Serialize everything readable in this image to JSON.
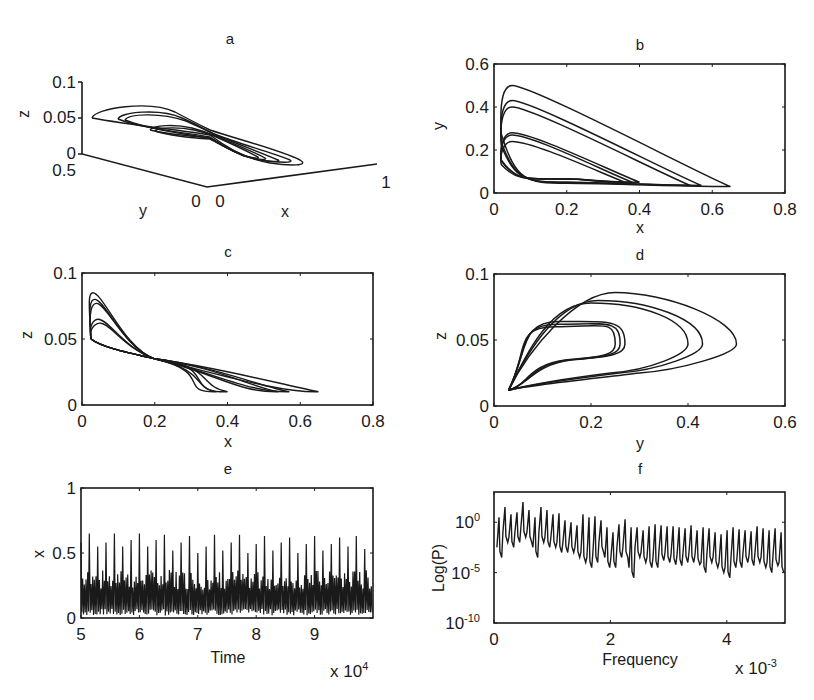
{
  "figure": {
    "panels": [
      "a",
      "b",
      "c",
      "d",
      "e",
      "f"
    ]
  },
  "chart_data": [
    {
      "id": "a",
      "type": "line",
      "title": "a",
      "projection": "3d",
      "xlabel": "x",
      "ylabel": "y",
      "zlabel": "z",
      "xticks": [
        "0",
        "1"
      ],
      "yticks": [
        "0",
        "0.5"
      ],
      "zticks": [
        "0",
        "0.05",
        "0.1"
      ],
      "xlim": [
        0,
        1
      ],
      "ylim": [
        0,
        0.5
      ],
      "zlim": [
        0,
        0.1
      ],
      "description": "3D phase portrait of chaotic attractor (x,y,z)",
      "box": {
        "origin": [
          82,
          154
        ],
        "ytip": [
          82,
          154
        ],
        "corner": [
          207,
          187
        ],
        "xend": [
          377,
          164
        ],
        "ztop": [
          82,
          82
        ]
      }
    },
    {
      "id": "b",
      "type": "line",
      "title": "b",
      "xlabel": "x",
      "ylabel": "y",
      "xticks": [
        "0",
        "0.2",
        "0.4",
        "0.6",
        "0.8"
      ],
      "yticks": [
        "0",
        "0.2",
        "0.4",
        "0.6"
      ],
      "xlim": [
        0,
        0.8
      ],
      "ylim": [
        0,
        0.6
      ],
      "description": "x-y projection: nested loops with right tips near x=0.38,0.40,0.54,0.57,0.65",
      "loops": [
        {
          "top_y": 0.5,
          "tip_x": 0.65,
          "tip_y": 0.03
        },
        {
          "top_y": 0.43,
          "tip_x": 0.57,
          "tip_y": 0.035
        },
        {
          "top_y": 0.4,
          "tip_x": 0.54,
          "tip_y": 0.035
        },
        {
          "top_y": 0.28,
          "tip_x": 0.4,
          "tip_y": 0.05
        },
        {
          "top_y": 0.27,
          "tip_x": 0.38,
          "tip_y": 0.05
        },
        {
          "top_y": 0.24,
          "tip_x": 0.36,
          "tip_y": 0.05
        }
      ],
      "box": [
        494,
        64,
        785,
        193
      ]
    },
    {
      "id": "c",
      "type": "line",
      "title": "c",
      "xlabel": "x",
      "ylabel": "z",
      "xticks": [
        "0",
        "0.2",
        "0.4",
        "0.6",
        "0.8"
      ],
      "yticks": [
        "0",
        "0.05",
        "0.1"
      ],
      "xlim": [
        0,
        0.8
      ],
      "ylim": [
        0,
        0.1
      ],
      "description": "x-z projection: peaks z≈0.085 near x≈0.03, crossing near x≈0.2,z≈0.035, tail to x≈0.65,z≈0.01",
      "loops": [
        {
          "peak_z": 0.085,
          "tip_x": 0.65
        },
        {
          "peak_z": 0.08,
          "tip_x": 0.57
        },
        {
          "peak_z": 0.077,
          "tip_x": 0.54
        },
        {
          "peak_z": 0.065,
          "tip_x": 0.4
        },
        {
          "peak_z": 0.062,
          "tip_x": 0.37
        }
      ],
      "box": [
        82,
        273,
        373,
        405
      ]
    },
    {
      "id": "d",
      "type": "line",
      "title": "d",
      "xlabel": "y",
      "ylabel": "z",
      "xticks": [
        "0",
        "0.2",
        "0.4",
        "0.6"
      ],
      "yticks": [
        "0",
        "0.05",
        "0.1"
      ],
      "xlim": [
        0,
        0.6
      ],
      "ylim": [
        0,
        0.1
      ],
      "description": "y-z projection: loops from (0.03,0.012) with right tips at y≈0.25,0.27,0.40,0.43,0.50",
      "loops": [
        {
          "top_z": 0.086,
          "tip_y": 0.5
        },
        {
          "top_z": 0.08,
          "tip_y": 0.43
        },
        {
          "top_z": 0.078,
          "tip_y": 0.4
        },
        {
          "top_z": 0.064,
          "tip_y": 0.27
        },
        {
          "top_z": 0.062,
          "tip_y": 0.26
        },
        {
          "top_z": 0.06,
          "tip_y": 0.25
        }
      ],
      "box": [
        494,
        274,
        785,
        406
      ]
    },
    {
      "id": "e",
      "type": "line",
      "title": "e",
      "xlabel": "Time",
      "ylabel": "x",
      "xticks": [
        "5",
        "6",
        "7",
        "8",
        "9"
      ],
      "yticks": [
        "0",
        "0.5",
        "1"
      ],
      "x_multiplier": "x 10^4",
      "xlim": [
        5,
        10
      ],
      "ylim": [
        0,
        1
      ],
      "description": "Time series of x: dense oscillations 0–0.35 with ~34 spikes reaching 0.5–0.65",
      "spike_heights": [
        0.58,
        0.65,
        0.55,
        0.58,
        0.65,
        0.55,
        0.6,
        0.65,
        0.55,
        0.6,
        0.64,
        0.52,
        0.58,
        0.63,
        0.5,
        0.55,
        0.64,
        0.52,
        0.58,
        0.64,
        0.5,
        0.57,
        0.63,
        0.52,
        0.58,
        0.62,
        0.5,
        0.57,
        0.63,
        0.52,
        0.57,
        0.62,
        0.55,
        0.63,
        0.53
      ],
      "box": [
        81,
        488,
        373,
        618
      ]
    },
    {
      "id": "f",
      "type": "line",
      "title": "f",
      "xlabel": "Frequency",
      "ylabel": "Log(P)",
      "xticks": [
        "0",
        "2",
        "4"
      ],
      "yticks": [
        "10^-10",
        "10^-5",
        "10^0"
      ],
      "x_multiplier": "x 10^-3",
      "xlim": [
        0,
        5
      ],
      "ylim_log10": [
        -10,
        3
      ],
      "description": "Power spectrum (log scale): comb of peaks from ~10^2 down to baseline ~10^-3 to 10^-5",
      "peak_log10": [
        0.5,
        1.5,
        0.8,
        1.0,
        2.0,
        1.2,
        0.5,
        1.5,
        1.2,
        0.8,
        0.9,
        0.2,
        0.0,
        -0.3,
        0.8,
        0.5,
        0.6,
        0.2,
        -0.5,
        -1.0,
        -0.2,
        0.3,
        -0.5,
        -0.5,
        -0.8,
        -0.4,
        -0.2,
        -0.3,
        -0.4,
        -0.4,
        -0.5,
        -0.6,
        -0.3,
        -0.8,
        -0.5,
        -0.6,
        -1.0,
        -1.2,
        -0.8,
        -0.5,
        -0.7,
        -0.8,
        -0.9,
        -0.4,
        -0.6,
        -0.8,
        -0.6,
        -1.0
      ],
      "trough_log10": [
        -3.5,
        -2.0,
        -2.5,
        -2.0,
        -1.5,
        -2.0,
        -3.5,
        -2.0,
        -2.5,
        -2.5,
        -3.0,
        -3.0,
        -3.0,
        -3.5,
        -4.0,
        -4.5,
        -4.0,
        -3.0,
        -4.5,
        -4.5,
        -3.5,
        -3.5,
        -5.5,
        -3.5,
        -4.0,
        -4.5,
        -4.5,
        -3.8,
        -4.0,
        -4.2,
        -4.3,
        -4.0,
        -4.0,
        -4.2,
        -5.0,
        -4.0,
        -4.5,
        -5.0,
        -5.5,
        -4.5,
        -4.5,
        -4.0,
        -4.3,
        -4.0,
        -4.5,
        -5.0,
        -4.3,
        -5.0
      ],
      "box": [
        494,
        492,
        785,
        623
      ]
    }
  ]
}
